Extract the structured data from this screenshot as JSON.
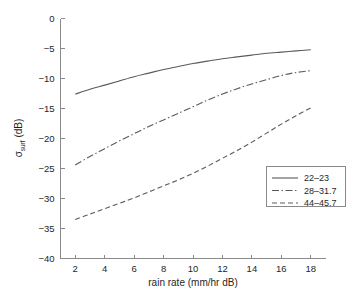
{
  "chart_data": {
    "type": "line",
    "title": "",
    "xlabel": "rain rate (mm/hr dB)",
    "ylabel_main": "σ",
    "ylabel_sub": "surf",
    "ylabel_tail": " (dB)",
    "ylabel_full": "σsurf (dB)",
    "xlim": [
      1,
      19
    ],
    "ylim": [
      -40,
      0
    ],
    "xticks": [
      2,
      4,
      6,
      8,
      10,
      12,
      14,
      16,
      18
    ],
    "xtick_labels": [
      "2",
      "4",
      "6",
      "8",
      "10",
      "12",
      "14",
      "16",
      "18"
    ],
    "yticks": [
      0,
      -5,
      -10,
      -15,
      -20,
      -25,
      -30,
      -35,
      -40
    ],
    "ytick_labels": [
      "0",
      "−5",
      "−10",
      "−15",
      "−20",
      "−25",
      "−30",
      "−35",
      "−40"
    ],
    "grid": false,
    "legend_position": "lower right",
    "line_color": "#5a5a5a",
    "axis_color": "#8a8a8a",
    "x": [
      2,
      3,
      4,
      5,
      6,
      7,
      8,
      9,
      10,
      11,
      12,
      13,
      14,
      15,
      16,
      17,
      18
    ],
    "series": [
      {
        "name": "22–23",
        "style": "solid",
        "dasharray": "none",
        "values": [
          -12.6,
          -11.8,
          -11.1,
          -10.4,
          -9.7,
          -9.1,
          -8.5,
          -8.0,
          -7.5,
          -7.1,
          -6.7,
          -6.4,
          -6.1,
          -5.8,
          -5.6,
          -5.4,
          -5.2
        ]
      },
      {
        "name": "28–31.7",
        "style": "dashdot",
        "dasharray": "7,2.5,1.5,2.5",
        "values": [
          -24.4,
          -23.0,
          -21.7,
          -20.4,
          -19.2,
          -18.0,
          -16.9,
          -15.8,
          -14.7,
          -13.6,
          -12.6,
          -11.7,
          -10.9,
          -10.2,
          -9.5,
          -9.0,
          -8.7
        ]
      },
      {
        "name": "44–45.7",
        "style": "dashed",
        "dasharray": "5,3",
        "values": [
          -33.5,
          -32.6,
          -31.7,
          -30.8,
          -29.9,
          -28.9,
          -27.9,
          -26.9,
          -25.8,
          -24.6,
          -23.3,
          -22.0,
          -20.6,
          -19.1,
          -17.6,
          -16.2,
          -14.9
        ]
      }
    ]
  },
  "legend": {
    "items": [
      {
        "label": "22–23"
      },
      {
        "label": "28–31.7"
      },
      {
        "label": "44–45.7"
      }
    ]
  }
}
